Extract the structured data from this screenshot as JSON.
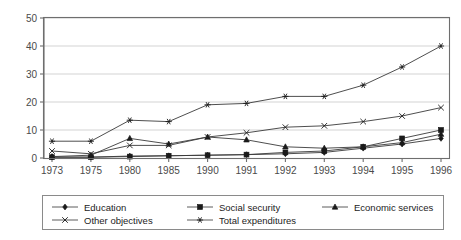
{
  "chart_data": {
    "type": "line",
    "title": "",
    "xlabel": "",
    "ylabel": "",
    "categories": [
      "1973",
      "1975",
      "1980",
      "1985",
      "1990",
      "1991",
      "1992",
      "1993",
      "1994",
      "1995",
      "1996"
    ],
    "ylim": [
      0,
      50
    ],
    "yticks": [
      0,
      10,
      20,
      30,
      40,
      50
    ],
    "grid": true,
    "legend_position": "bottom",
    "series": [
      {
        "name": "Education",
        "marker": "diamond",
        "values": [
          0.3,
          0.3,
          0.7,
          0.8,
          1.0,
          1.2,
          1.5,
          2.0,
          3.5,
          5.0,
          7.0
        ]
      },
      {
        "name": "Social security",
        "marker": "square",
        "values": [
          0.3,
          0.3,
          0.5,
          0.8,
          1.0,
          1.2,
          2.0,
          2.5,
          4.0,
          7.0,
          10.0
        ]
      },
      {
        "name": "Economic services",
        "marker": "triangle",
        "values": [
          0.5,
          1.0,
          7.0,
          5.0,
          7.5,
          6.5,
          4.0,
          3.5,
          4.0,
          5.5,
          8.5
        ]
      },
      {
        "name": "Other objectives",
        "marker": "cross",
        "values": [
          2.5,
          1.5,
          4.5,
          4.5,
          7.5,
          9.0,
          11.0,
          11.5,
          13.0,
          15.0,
          18.0
        ]
      },
      {
        "name": "Total expenditures",
        "marker": "asterisk",
        "values": [
          6.0,
          6.0,
          13.5,
          13.0,
          19.0,
          19.5,
          22.0,
          22.0,
          26.0,
          32.5,
          40.0
        ]
      }
    ]
  },
  "colors": {
    "line": "#3a3a3a",
    "marker": "#1a1a1a",
    "grid": "#c8c8c8",
    "axis": "#6e6e6e",
    "tick_label": "#4a4a4a",
    "legend_text": "#1c1c1c",
    "legend_border": "#8a8a8a",
    "background": "#ffffff"
  },
  "axes": {
    "y_tick_labels": [
      "0",
      "10",
      "20",
      "30",
      "40",
      "50"
    ],
    "x_tick_labels": [
      "1973",
      "1975",
      "1980",
      "1985",
      "1990",
      "1991",
      "1992",
      "1993",
      "1994",
      "1995",
      "1996"
    ]
  },
  "legend": {
    "entries": [
      {
        "label": "Education",
        "marker": "diamond"
      },
      {
        "label": "Social security",
        "marker": "square"
      },
      {
        "label": "Economic services",
        "marker": "triangle"
      },
      {
        "label": "Other objectives",
        "marker": "cross"
      },
      {
        "label": "Total expenditures",
        "marker": "asterisk"
      }
    ]
  }
}
